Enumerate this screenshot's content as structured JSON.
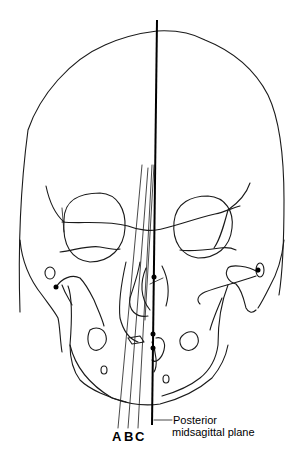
{
  "diagram": {
    "line_labels": {
      "a": "A",
      "b": "B",
      "c": "C"
    },
    "plane_label": {
      "line1": "Posterior",
      "line2": "midsagittal plane"
    },
    "colors": {
      "ink": "#000000",
      "background": "#ffffff"
    }
  }
}
